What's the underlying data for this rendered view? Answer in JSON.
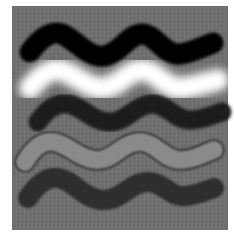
{
  "image": {
    "background_color": "#6e6e6e",
    "page_color": "#ffffff",
    "strokes": [
      {
        "name": "black-wave",
        "color": "#050505",
        "width": 21,
        "blur": 1.5,
        "path": "M30,52 C40,38 52,30 62,34 C76,40 88,58 104,56 C120,54 128,34 142,34 C156,34 164,56 180,54 C194,52 204,46 213,43"
      },
      {
        "name": "white-wave",
        "color": "#ffffff",
        "width": 22,
        "blur": 4,
        "path": "M30,88 C40,76 50,68 60,70 C76,74 88,90 104,88 C120,86 128,70 142,70 C156,70 166,90 182,88 C198,86 208,82 218,80"
      },
      {
        "name": "dark-wave",
        "color": "#1e1e1e",
        "width": 19,
        "blur": 1.5,
        "path": "M38,122 C46,110 56,102 68,104 C82,106 92,122 110,122 C126,122 134,106 150,104 C166,102 174,120 190,120 C204,120 214,114 222,112"
      },
      {
        "name": "outlined-gray-wave",
        "color": "#8a8a8a",
        "outline": "#2a2a2a",
        "width": 18,
        "blur": 0.8,
        "path": "M25,162 C32,150 42,140 54,142 C68,144 80,160 98,160 C114,160 122,142 140,142 C156,142 164,160 180,160 C196,160 206,152 214,150"
      },
      {
        "name": "dark-gray-wave",
        "color": "#2f2f2f",
        "width": 20,
        "blur": 1.2,
        "path": "M28,198 C36,186 46,176 58,178 C74,180 84,200 104,200 C122,200 130,182 148,182 C164,182 170,198 186,196 C200,194 208,190 214,188"
      }
    ]
  }
}
